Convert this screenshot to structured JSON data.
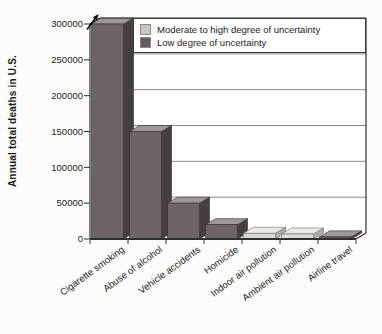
{
  "chart_data": {
    "type": "bar",
    "style": "3d-perspective-bars",
    "title": "",
    "ylabel": "Annual total deaths in U.S.",
    "xlabel": "",
    "ylim": [
      0,
      300000
    ],
    "ytick_step": 50000,
    "ytick_labels": [
      "0",
      "50000",
      "100000",
      "150000",
      "200000",
      "250000",
      "300000"
    ],
    "grid": true,
    "legend_position": "top-right inside plot",
    "categories": [
      "Cigarette smoking",
      "Abuse of alcohol",
      "Vehicle accidents",
      "Homicide",
      "Indoor air pollution",
      "Ambient air pollution",
      "Airline travel"
    ],
    "series": [
      {
        "name": "Annual total deaths in U.S.",
        "values": [
          300000,
          150000,
          50000,
          20000,
          8000,
          7000,
          3000
        ],
        "uncertainty": [
          "low",
          "low",
          "low",
          "low",
          "moderate-high",
          "moderate-high",
          "low"
        ]
      }
    ],
    "legend": [
      {
        "key": "moderate-high",
        "label": "Moderate to high degree of uncertainty",
        "color": "#c9c8c1"
      },
      {
        "key": "low",
        "label": "Low degree of uncertainty",
        "color": "#635b5e"
      }
    ],
    "annotations": [
      {
        "type": "arrow",
        "category": "Cigarette smoking",
        "meaning": "bar extends beyond top of axis"
      }
    ]
  },
  "colors": {
    "plot_bg": "#ffffff",
    "page_bg": "#fcfcfb",
    "gridline": "#8a8a8a",
    "axis": "#2e2e2e",
    "text": "#1b1b1b",
    "bar_low_front": "#6c6467",
    "bar_low_top": "#9e979b",
    "bar_low_side": "#453f42",
    "bar_low_outline": "#2f2b2d",
    "bar_high_front": "#dbdad4",
    "bar_high_top": "#eceae4",
    "bar_high_side": "#aeada7",
    "bar_high_outline": "#6f6e6a"
  }
}
